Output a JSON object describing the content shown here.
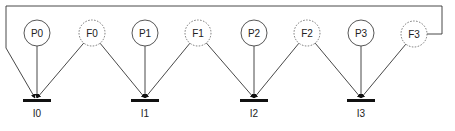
{
  "diagram": {
    "nodes": [
      {
        "id": "P0",
        "label": "P0",
        "style": "solid",
        "cx": 37,
        "cy": 33
      },
      {
        "id": "F0",
        "label": "F0",
        "style": "dashed",
        "cx": 92,
        "cy": 33
      },
      {
        "id": "P1",
        "label": "P1",
        "style": "solid",
        "cx": 145,
        "cy": 33
      },
      {
        "id": "F1",
        "label": "F1",
        "style": "dashed",
        "cx": 198,
        "cy": 33
      },
      {
        "id": "P2",
        "label": "P2",
        "style": "solid",
        "cx": 254,
        "cy": 33
      },
      {
        "id": "F2",
        "label": "F2",
        "style": "dashed",
        "cx": 307,
        "cy": 33
      },
      {
        "id": "P3",
        "label": "P3",
        "style": "solid",
        "cx": 361,
        "cy": 33
      },
      {
        "id": "F3",
        "label": "F3",
        "style": "dashed",
        "cx": 414,
        "cy": 34
      }
    ],
    "sinks": [
      {
        "id": "I0",
        "label": "I0",
        "x": 37,
        "y": 100
      },
      {
        "id": "I1",
        "label": "I1",
        "x": 145,
        "y": 100
      },
      {
        "id": "I2",
        "label": "I2",
        "x": 254,
        "y": 100
      },
      {
        "id": "I3",
        "label": "I3",
        "x": 361,
        "y": 100
      }
    ],
    "edges": [
      [
        "P0",
        "I0"
      ],
      [
        "F0",
        "I0"
      ],
      [
        "F0",
        "I1"
      ],
      [
        "P1",
        "I1"
      ],
      [
        "F1",
        "I1"
      ],
      [
        "F1",
        "I2"
      ],
      [
        "P2",
        "I2"
      ],
      [
        "F2",
        "I2"
      ],
      [
        "F2",
        "I3"
      ],
      [
        "P3",
        "I3"
      ],
      [
        "F3",
        "I3"
      ],
      [
        "F3",
        "I0",
        "wrap-around"
      ]
    ]
  }
}
